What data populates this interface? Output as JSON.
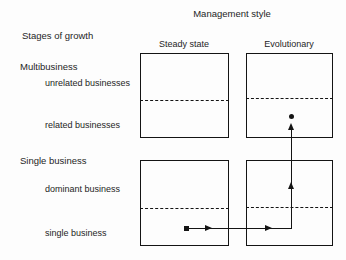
{
  "diagram": {
    "title": "Management style",
    "row_axis_title": "Stages of growth",
    "columns": [
      {
        "id": "steady-state",
        "label": "Steady state"
      },
      {
        "id": "evolutionary",
        "label": "Evolutionary"
      }
    ],
    "row_groups": [
      {
        "id": "multibusiness",
        "label": "Multibusiness",
        "rows": [
          {
            "id": "unrelated-businesses",
            "label": "unrelated businesses"
          },
          {
            "id": "related-businesses",
            "label": "related businesses"
          }
        ]
      },
      {
        "id": "single-business",
        "label": "Single business",
        "rows": [
          {
            "id": "dominant-business",
            "label": "dominant business"
          },
          {
            "id": "single-business-row",
            "label": "single business"
          }
        ]
      }
    ],
    "colors": {
      "ink": "#141414",
      "text": "#252525",
      "background": "#fdfdfd"
    }
  },
  "path": {
    "description": "growth path from single business / steady state to related businesses / evolutionary",
    "start_cell": "single-business__steady-state",
    "end_cell": "related-businesses__evolutionary",
    "markers": [
      "square-start-marker",
      "round-end-marker"
    ],
    "arrowheads": 3
  }
}
